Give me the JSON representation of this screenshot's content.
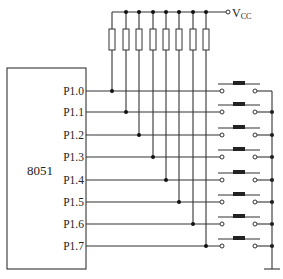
{
  "diagram": {
    "type": "circuit-schematic",
    "chip": {
      "label": "8051"
    },
    "supply": {
      "label": "V",
      "subscript": "CC"
    },
    "pins": [
      {
        "label": "P1.0",
        "y": 91
      },
      {
        "label": "P1.1",
        "y": 112
      },
      {
        "label": "P1.2",
        "y": 135
      },
      {
        "label": "P1.3",
        "y": 157
      },
      {
        "label": "P1.4",
        "y": 180
      },
      {
        "label": "P1.5",
        "y": 202
      },
      {
        "label": "P1.6",
        "y": 224
      },
      {
        "label": "P1.7",
        "y": 246
      }
    ],
    "pullup_x": [
      112,
      126,
      139,
      153,
      166,
      179,
      193,
      206
    ],
    "resistor_count": 8,
    "switch_count": 8,
    "ground": true,
    "colors": {
      "line": "#333333",
      "text": "#222222",
      "background": "#ffffff"
    }
  }
}
